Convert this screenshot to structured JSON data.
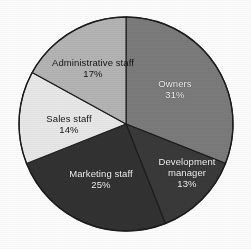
{
  "chart_data": {
    "type": "pie",
    "title": "",
    "subtitle": "",
    "xlabel": "",
    "ylabel": "",
    "legend_position": "none",
    "grid": false,
    "units": "percent",
    "start_angle_deg": 0,
    "direction": "clockwise",
    "categories": [
      "Owners",
      "Development manager",
      "Marketing staff",
      "Sales staff",
      "Administrative staff"
    ],
    "values": [
      31,
      13,
      25,
      14,
      17
    ],
    "slices": [
      {
        "label": "Owners",
        "value_text": "31%",
        "value": 31,
        "color": "#7b7b7b",
        "label_color": "light"
      },
      {
        "label_line1": "Development",
        "label_line2": "manager",
        "label": "Development manager",
        "value_text": "13%",
        "value": 13,
        "color": "#3a3a3a",
        "label_color": "light"
      },
      {
        "label": "Marketing staff",
        "value_text": "25%",
        "value": 25,
        "color": "#323232",
        "label_color": "light"
      },
      {
        "label": "Sales staff",
        "value_text": "14%",
        "value": 14,
        "color": "#e8e8e8",
        "label_color": "dark"
      },
      {
        "label": "Administrative staff",
        "value_text": "17%",
        "value": 17,
        "color": "#b4b4b4",
        "label_color": "dark"
      }
    ],
    "geometry": {
      "center_x": 126,
      "center_y": 124,
      "radius": 107
    },
    "colors": {
      "background": "#fdfdfd",
      "outline": "#1c1c1c",
      "text_on_dark": "#f2f2f2",
      "text_on_light": "#141414"
    }
  }
}
